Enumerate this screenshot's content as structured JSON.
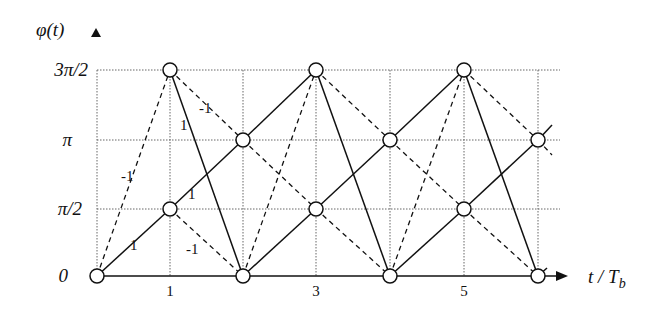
{
  "diagram": {
    "type": "phase-trellis",
    "y_axis_label": "φ(t)",
    "x_axis_label": "t / T_b",
    "x_axis_label_main": "t / T",
    "x_axis_label_sub": "b",
    "y_ticks": [
      "0",
      "π/2",
      "π",
      "3π/2"
    ],
    "x_ticks": [
      "1",
      "3",
      "5"
    ],
    "edge_labels": [
      {
        "text": "1",
        "pos": [
          132,
          248
        ]
      },
      {
        "text": "1",
        "pos": [
          188,
          197
        ]
      },
      {
        "text": "-1",
        "pos": [
          195,
          253
        ]
      },
      {
        "text": "-1",
        "pos": [
          126,
          180
        ]
      },
      {
        "text": "1",
        "pos": [
          183,
          129
        ]
      },
      {
        "text": "-1",
        "pos": [
          206,
          112
        ]
      }
    ],
    "legend": {
      "solid": "+1 data bit",
      "dashed": "-1 data bit"
    },
    "colors": {
      "line": "#111111",
      "grid": "#555555",
      "node_fill": "#ffffff"
    }
  }
}
